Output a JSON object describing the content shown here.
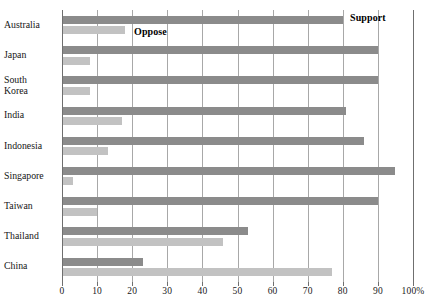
{
  "chart_data": {
    "type": "bar",
    "orientation": "horizontal",
    "title": "",
    "subtitle": "",
    "xlabel": "",
    "ylabel": "",
    "xlim": [
      0,
      100
    ],
    "grid": true,
    "grid_axis": "x",
    "legend_position": "inline-annotation",
    "categories": [
      "Australia",
      "Japan",
      "South\nKorea",
      "India",
      "Indonesia",
      "Singapore",
      "Taiwan",
      "Thailand",
      "China"
    ],
    "series": [
      {
        "name": "Support",
        "color": "#8b8b8b",
        "values": [
          80,
          90,
          90,
          81,
          86,
          95,
          90,
          53,
          23
        ]
      },
      {
        "name": "Oppose",
        "color": "#c2c2c2",
        "values": [
          18,
          8,
          8,
          17,
          13,
          3,
          10,
          46,
          77
        ]
      }
    ],
    "xticks": [
      0,
      10,
      20,
      30,
      40,
      50,
      60,
      70,
      80,
      90,
      100
    ],
    "xticklabels": [
      "0",
      "10",
      "20",
      "30",
      "40",
      "50",
      "60",
      "70",
      "80",
      "90",
      "100%"
    ],
    "annotations": [
      {
        "text": "Oppose",
        "name": "oppose-series-label"
      },
      {
        "text": "Support",
        "name": "support-series-label"
      }
    ]
  },
  "axis": {
    "left_frame_color": "#6f6f6f",
    "right_frame_color": "#6f6f6f",
    "gridline_color": "#a8a8a8"
  }
}
